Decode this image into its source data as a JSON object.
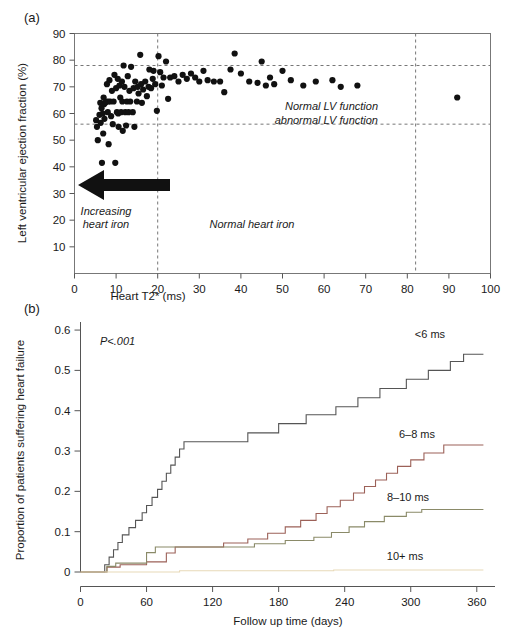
{
  "figure": {
    "panel_a": {
      "label": "(a)",
      "xlabel": "Heart T2* (ms)",
      "ylabel": "Left ventricular ejection fraction (%)",
      "xlim": [
        0,
        100
      ],
      "ylim": [
        0,
        90
      ],
      "xticks": [
        0,
        10,
        20,
        30,
        40,
        50,
        60,
        70,
        80,
        90,
        100
      ],
      "yticks": [
        10,
        20,
        30,
        40,
        50,
        60,
        70,
        80,
        90
      ],
      "hlines": [
        78,
        56
      ],
      "vlines": [
        20,
        82
      ],
      "annotations": {
        "normal_lv": "Normal LV function",
        "abnormal_lv": "abnormal LV function",
        "increasing_iron_line1": "Increasing",
        "increasing_iron_line2": "heart iron",
        "normal_iron": "Normal heart iron"
      }
    },
    "panel_b": {
      "label": "(b)",
      "xlabel": "Follow up time (days)",
      "ylabel": "Proportion of patients suffering heart failure",
      "xlim": [
        0,
        372
      ],
      "ylim": [
        0,
        0.62
      ],
      "xticks": [
        0,
        60,
        120,
        180,
        240,
        300,
        360
      ],
      "yticks": [
        "0",
        "0.1",
        "0.2",
        "0.3",
        "0.4",
        "0.5",
        "0.6"
      ],
      "ytick_values": [
        0,
        0.1,
        0.2,
        0.3,
        0.4,
        0.5,
        0.6
      ],
      "pvalue": "P<.001",
      "curve_labels": [
        "<6 ms",
        "6–8 ms",
        "8–10 ms",
        "10+ ms"
      ]
    }
  },
  "chart_data": [
    {
      "type": "scatter",
      "title": "(a) Left ventricular ejection fraction versus heart T2*",
      "xlabel": "Heart T2* (ms)",
      "ylabel": "Left ventricular ejection fraction (%)",
      "xlim": [
        0,
        100
      ],
      "ylim": [
        0,
        90
      ],
      "xticks": [
        0,
        10,
        20,
        30,
        40,
        50,
        60,
        70,
        80,
        90,
        100
      ],
      "yticks": [
        10,
        20,
        30,
        40,
        50,
        60,
        70,
        80,
        90
      ],
      "grid": false,
      "reference_lines": {
        "horizontal": [
          {
            "y": 78,
            "style": "dashed",
            "meaning": "upper normal LVEF bound"
          },
          {
            "y": 56,
            "style": "dashed",
            "label_above": "Normal LV function",
            "label_below": "abnormal LV function"
          }
        ],
        "vertical": [
          {
            "x": 20,
            "style": "dashed",
            "meaning": "normal heart iron threshold"
          },
          {
            "x": 82,
            "style": "dashed"
          }
        ]
      },
      "annotations": [
        {
          "text": "Increasing heart iron",
          "x": 9,
          "y": 13,
          "style": "italic",
          "arrow": "left-pointing-thick-arrow at y=18 from x=17 to x=1"
        },
        {
          "text": "Normal heart iron",
          "x": 35,
          "y": 11,
          "style": "italic"
        }
      ],
      "points": [
        [
          5.2,
          57.5
        ],
        [
          5.4,
          55.0
        ],
        [
          5.6,
          50.0
        ],
        [
          6.0,
          59.5
        ],
        [
          6.2,
          64.0
        ],
        [
          6.3,
          56.5
        ],
        [
          6.5,
          62.0
        ],
        [
          6.6,
          41.5
        ],
        [
          6.8,
          60.0
        ],
        [
          6.9,
          52.5
        ],
        [
          7.0,
          66.0
        ],
        [
          7.1,
          63.5
        ],
        [
          7.2,
          58.0
        ],
        [
          7.4,
          64.0
        ],
        [
          7.6,
          64.5
        ],
        [
          7.8,
          71.0
        ],
        [
          8.0,
          60.5
        ],
        [
          8.1,
          64.5
        ],
        [
          8.2,
          48.5
        ],
        [
          8.4,
          72.5
        ],
        [
          8.6,
          64.5
        ],
        [
          8.8,
          59.0
        ],
        [
          9.0,
          68.5
        ],
        [
          9.2,
          56.0
        ],
        [
          9.4,
          64.5
        ],
        [
          9.6,
          74.5
        ],
        [
          9.8,
          41.5
        ],
        [
          10.0,
          69.5
        ],
        [
          10.2,
          60.5
        ],
        [
          10.4,
          73.0
        ],
        [
          10.5,
          60.0
        ],
        [
          10.6,
          55.0
        ],
        [
          10.8,
          70.5
        ],
        [
          11.0,
          66.0
        ],
        [
          11.2,
          60.5
        ],
        [
          11.4,
          72.0
        ],
        [
          11.5,
          64.5
        ],
        [
          11.6,
          53.5
        ],
        [
          11.8,
          78.0
        ],
        [
          12.0,
          70.0
        ],
        [
          12.2,
          60.5
        ],
        [
          12.4,
          55.5
        ],
        [
          12.6,
          64.5
        ],
        [
          12.8,
          74.0
        ],
        [
          13.0,
          60.5
        ],
        [
          13.2,
          68.5
        ],
        [
          13.4,
          64.5
        ],
        [
          13.6,
          77.5
        ],
        [
          14.0,
          60.5
        ],
        [
          14.2,
          69.5
        ],
        [
          14.4,
          55.0
        ],
        [
          14.6,
          72.0
        ],
        [
          15.0,
          64.5
        ],
        [
          15.2,
          70.0
        ],
        [
          15.4,
          67.5
        ],
        [
          15.8,
          82.0
        ],
        [
          16.0,
          71.0
        ],
        [
          16.2,
          64.0
        ],
        [
          16.5,
          69.0
        ],
        [
          17.0,
          72.0
        ],
        [
          17.4,
          66.5
        ],
        [
          17.8,
          70.0
        ],
        [
          18.0,
          76.5
        ],
        [
          18.4,
          69.5
        ],
        [
          18.8,
          73.0
        ],
        [
          19.0,
          76.0
        ],
        [
          19.4,
          71.0
        ],
        [
          19.8,
          61.0
        ],
        [
          20.2,
          81.5
        ],
        [
          20.6,
          75.5
        ],
        [
          21.0,
          70.5
        ],
        [
          21.4,
          73.5
        ],
        [
          22.0,
          79.5
        ],
        [
          22.5,
          65.5
        ],
        [
          23.0,
          73.5
        ],
        [
          24.0,
          74.0
        ],
        [
          25.0,
          72.0
        ],
        [
          26.0,
          74.5
        ],
        [
          27.0,
          73.0
        ],
        [
          28.0,
          75.0
        ],
        [
          29.0,
          73.5
        ],
        [
          30.0,
          72.0
        ],
        [
          31.0,
          76.0
        ],
        [
          32.0,
          72.5
        ],
        [
          33.5,
          72.0
        ],
        [
          35.0,
          72.0
        ],
        [
          36.0,
          68.0
        ],
        [
          37.5,
          76.5
        ],
        [
          38.5,
          82.5
        ],
        [
          40.0,
          75.0
        ],
        [
          42.0,
          72.0
        ],
        [
          44.0,
          71.5
        ],
        [
          45.0,
          79.5
        ],
        [
          46.0,
          70.5
        ],
        [
          47.0,
          73.5
        ],
        [
          48.0,
          71.0
        ],
        [
          50.0,
          76.0
        ],
        [
          52.0,
          72.5
        ],
        [
          55.0,
          70.5
        ],
        [
          58.0,
          72.0
        ],
        [
          62.0,
          72.5
        ],
        [
          64.0,
          70.0
        ],
        [
          68.0,
          70.5
        ],
        [
          92.0,
          66.0
        ]
      ],
      "n_points": 104
    },
    {
      "type": "line",
      "subtype": "kaplan-meier-step",
      "title": "(b) Proportion of patients suffering heart failure over follow up",
      "xlabel": "Follow up time (days)",
      "ylabel": "Proportion of patients suffering heart failure",
      "xlim": [
        0,
        372
      ],
      "ylim": [
        0,
        0.62
      ],
      "xticks": [
        0,
        60,
        120,
        180,
        240,
        300,
        360
      ],
      "yticks": [
        0,
        0.1,
        0.2,
        0.3,
        0.4,
        0.5,
        0.6
      ],
      "grid": false,
      "legend_position": "inline-right-end-of-curve",
      "annotations": [
        {
          "text": "P<.001",
          "x": 30,
          "y": 0.555,
          "style": "italic"
        }
      ],
      "series": [
        {
          "name": "<6 ms",
          "color": "#555555",
          "final_value": 0.54,
          "steps": [
            [
              0,
              0.0
            ],
            [
              22,
              0.0
            ],
            [
              22,
              0.018
            ],
            [
              26,
              0.018
            ],
            [
              26,
              0.037
            ],
            [
              30,
              0.037
            ],
            [
              30,
              0.055
            ],
            [
              34,
              0.055
            ],
            [
              34,
              0.073
            ],
            [
              38,
              0.073
            ],
            [
              38,
              0.092
            ],
            [
              44,
              0.092
            ],
            [
              44,
              0.11
            ],
            [
              50,
              0.11
            ],
            [
              50,
              0.128
            ],
            [
              56,
              0.128
            ],
            [
              56,
              0.147
            ],
            [
              60,
              0.147
            ],
            [
              60,
              0.165
            ],
            [
              65,
              0.165
            ],
            [
              65,
              0.185
            ],
            [
              70,
              0.185
            ],
            [
              70,
              0.205
            ],
            [
              74,
              0.205
            ],
            [
              74,
              0.225
            ],
            [
              78,
              0.225
            ],
            [
              78,
              0.245
            ],
            [
              82,
              0.245
            ],
            [
              82,
              0.265
            ],
            [
              86,
              0.265
            ],
            [
              86,
              0.285
            ],
            [
              90,
              0.285
            ],
            [
              90,
              0.305
            ],
            [
              94,
              0.305
            ],
            [
              94,
              0.323
            ],
            [
              152,
              0.323
            ],
            [
              152,
              0.345
            ],
            [
              180,
              0.345
            ],
            [
              180,
              0.368
            ],
            [
              205,
              0.368
            ],
            [
              205,
              0.39
            ],
            [
              232,
              0.39
            ],
            [
              232,
              0.41
            ],
            [
              252,
              0.41
            ],
            [
              252,
              0.432
            ],
            [
              272,
              0.432
            ],
            [
              272,
              0.455
            ],
            [
              296,
              0.455
            ],
            [
              296,
              0.478
            ],
            [
              316,
              0.478
            ],
            [
              316,
              0.5
            ],
            [
              336,
              0.5
            ],
            [
              336,
              0.522
            ],
            [
              348,
              0.522
            ],
            [
              348,
              0.54
            ],
            [
              366,
              0.54
            ]
          ]
        },
        {
          "name": "6–8 ms",
          "color": "#9c6158",
          "final_value": 0.315,
          "steps": [
            [
              0,
              0.0
            ],
            [
              24,
              0.0
            ],
            [
              24,
              0.012
            ],
            [
              36,
              0.012
            ],
            [
              36,
              0.018
            ],
            [
              60,
              0.018
            ],
            [
              60,
              0.025
            ],
            [
              78,
              0.025
            ],
            [
              78,
              0.047
            ],
            [
              86,
              0.047
            ],
            [
              86,
              0.062
            ],
            [
              130,
              0.062
            ],
            [
              130,
              0.072
            ],
            [
              152,
              0.072
            ],
            [
              152,
              0.082
            ],
            [
              170,
              0.082
            ],
            [
              170,
              0.096
            ],
            [
              186,
              0.096
            ],
            [
              186,
              0.112
            ],
            [
              200,
              0.112
            ],
            [
              200,
              0.128
            ],
            [
              214,
              0.128
            ],
            [
              214,
              0.145
            ],
            [
              224,
              0.145
            ],
            [
              224,
              0.162
            ],
            [
              236,
              0.162
            ],
            [
              236,
              0.178
            ],
            [
              248,
              0.178
            ],
            [
              248,
              0.196
            ],
            [
              258,
              0.196
            ],
            [
              258,
              0.212
            ],
            [
              268,
              0.212
            ],
            [
              268,
              0.228
            ],
            [
              278,
              0.228
            ],
            [
              278,
              0.245
            ],
            [
              288,
              0.245
            ],
            [
              288,
              0.262
            ],
            [
              300,
              0.262
            ],
            [
              300,
              0.278
            ],
            [
              312,
              0.278
            ],
            [
              312,
              0.295
            ],
            [
              330,
              0.295
            ],
            [
              330,
              0.315
            ],
            [
              366,
              0.315
            ]
          ]
        },
        {
          "name": "8–10 ms",
          "color": "#8a8a68",
          "final_value": 0.155,
          "steps": [
            [
              0,
              0.0
            ],
            [
              24,
              0.0
            ],
            [
              24,
              0.014
            ],
            [
              32,
              0.014
            ],
            [
              32,
              0.022
            ],
            [
              60,
              0.022
            ],
            [
              60,
              0.048
            ],
            [
              68,
              0.048
            ],
            [
              68,
              0.062
            ],
            [
              158,
              0.062
            ],
            [
              158,
              0.07
            ],
            [
              186,
              0.07
            ],
            [
              186,
              0.078
            ],
            [
              212,
              0.078
            ],
            [
              212,
              0.086
            ],
            [
              228,
              0.086
            ],
            [
              228,
              0.098
            ],
            [
              244,
              0.098
            ],
            [
              244,
              0.112
            ],
            [
              258,
              0.112
            ],
            [
              258,
              0.125
            ],
            [
              276,
              0.125
            ],
            [
              276,
              0.138
            ],
            [
              296,
              0.138
            ],
            [
              296,
              0.148
            ],
            [
              310,
              0.148
            ],
            [
              310,
              0.155
            ],
            [
              366,
              0.155
            ]
          ]
        },
        {
          "name": "10+ ms",
          "color": "#e8d9b8",
          "final_value": 0.005,
          "steps": [
            [
              0,
              0.0
            ],
            [
              90,
              0.0
            ],
            [
              90,
              0.003
            ],
            [
              230,
              0.003
            ],
            [
              230,
              0.005
            ],
            [
              366,
              0.005
            ]
          ]
        }
      ]
    }
  ]
}
